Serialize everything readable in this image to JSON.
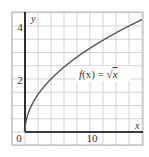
{
  "chart_data": {
    "type": "line",
    "title": "",
    "xlabel": "x",
    "ylabel": "y",
    "xlim": [
      -2,
      18
    ],
    "ylim": [
      -0.5,
      4.5
    ],
    "grid": true,
    "grid_x_step": 2,
    "grid_y_step": 0.5,
    "x_ticks": [
      0,
      10
    ],
    "y_ticks": [
      2,
      4
    ],
    "origin_label": "0",
    "series": [
      {
        "name": "f(x) = √x",
        "function": "sqrt(x)",
        "x": [
          0,
          0.25,
          1,
          2,
          3,
          4,
          6,
          8,
          10,
          12,
          14,
          16,
          18
        ],
        "values": [
          0,
          0.5,
          1,
          1.41,
          1.73,
          2,
          2.45,
          2.83,
          3.16,
          3.46,
          3.74,
          4,
          4.24
        ],
        "color": "#555555"
      }
    ],
    "annotations": [
      {
        "text": "f(x) = √x",
        "x": 12.5,
        "y": 2.1
      }
    ]
  },
  "labels": {
    "x_axis": "x",
    "y_axis": "y",
    "origin": "0",
    "x_tick_10": "10",
    "y_tick_2": "2",
    "y_tick_4": "4",
    "function_f": "f",
    "function_rest": "(x) = ",
    "function_sqrt": "√",
    "function_arg": "x"
  },
  "colors": {
    "grid": "#c8c8c8",
    "frame": "#b4b4b4",
    "axis": "#000000",
    "curve": "#555555",
    "text": "#333333"
  }
}
